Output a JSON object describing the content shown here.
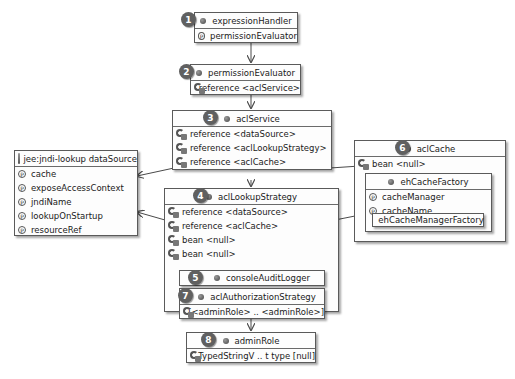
{
  "diagram": {
    "nodes": {
      "expressionHandler": {
        "badge": "1",
        "title": "expressionHandler",
        "rows": [
          "permissionEvaluator"
        ]
      },
      "permissionEvaluator": {
        "badge": "2",
        "title": "permissionEvaluator",
        "rows": [
          "reference <aclService>"
        ]
      },
      "aclService": {
        "badge": "3",
        "title": "aclService",
        "rows": [
          "reference <dataSource>",
          "reference <aclLookupStrategy>",
          "reference <aclCache>"
        ]
      },
      "dataSource": {
        "title": "jee:jndi-lookup dataSource",
        "rows": [
          "cache",
          "exposeAccessContext",
          "jndiName",
          "lookupOnStartup",
          "resourceRef"
        ]
      },
      "aclLookupStrategy": {
        "badge": "4",
        "title": "aclLookupStrategy",
        "rows": [
          "reference <dataSource>",
          "reference <aclCache>",
          "bean <null>",
          "bean <null>"
        ]
      },
      "consoleAuditLogger": {
        "badge": "5",
        "title": "consoleAuditLogger"
      },
      "aclCache": {
        "badge": "6",
        "title": "aclCache",
        "rows": [
          "bean <null>"
        ]
      },
      "ehCacheFactory": {
        "title": "ehCacheFactory",
        "rows": [
          "cacheManager",
          "cacheName"
        ]
      },
      "ehCacheManagerFactory": {
        "title": "ehCacheManagerFactory"
      },
      "aclAuthorizationStrategy": {
        "badge": "7",
        "title": "aclAuthorizationStrategy",
        "rows": [
          "[<adminRole> ..  <adminRole>]"
        ]
      },
      "adminRole": {
        "badge": "8",
        "title": "adminRole",
        "rows": [
          "TypedStringV .. t type [null]"
        ]
      }
    },
    "colors": {
      "border": "#5a5a5a",
      "badge": "#606060",
      "line": "#4a4a4a"
    }
  }
}
